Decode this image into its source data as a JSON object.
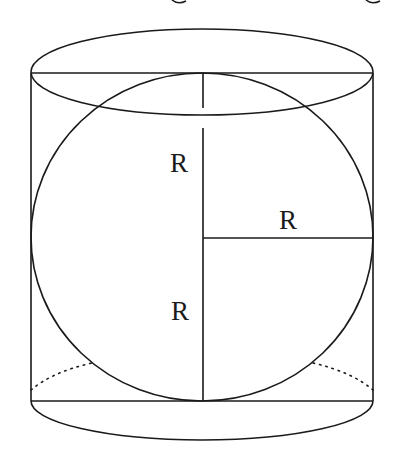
{
  "figure": {
    "labels": {
      "vertical_upper": "R",
      "horizontal_radius": "R",
      "vertical_lower": "R"
    },
    "colors": {
      "stroke": "#1a1a1a",
      "background": "#ffffff"
    }
  }
}
